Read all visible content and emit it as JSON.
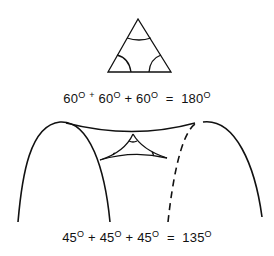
{
  "figure": {
    "flat_triangle": {
      "angles": [
        "60",
        "60",
        "60"
      ],
      "sum": "180",
      "unit": "O"
    },
    "saddle_triangle": {
      "angles": [
        "45",
        "45",
        "45"
      ],
      "sum": "135",
      "unit": "O"
    }
  },
  "equations": {
    "flat": {
      "a1": "60",
      "a2": "60",
      "a3": "60",
      "sum": "180",
      "deg": "O",
      "plus1": "+",
      "plus2": "+",
      "eq": "="
    },
    "saddle": {
      "a1": "45",
      "a2": "45",
      "a3": "45",
      "sum": "135",
      "deg": "O",
      "plus1": "+",
      "plus2": "+",
      "eq": "="
    }
  },
  "colors": {
    "ink": "#111111",
    "background": "#ffffff"
  }
}
